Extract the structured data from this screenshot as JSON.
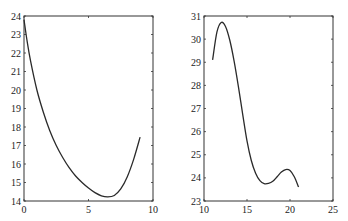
{
  "chart_data": [
    {
      "type": "line",
      "title": "",
      "xlabel": "",
      "ylabel": "",
      "xlim": [
        0,
        10
      ],
      "ylim": [
        14,
        24
      ],
      "grid": false,
      "legend": null,
      "xticks": [
        "0",
        "5",
        "10"
      ],
      "yticks": [
        "14",
        "15",
        "16",
        "17",
        "18",
        "19",
        "20",
        "21",
        "22",
        "23",
        "24"
      ],
      "series": [
        {
          "name": "curve",
          "color": "#2a2a2a",
          "x": [
            0,
            0.25,
            0.5,
            1,
            1.5,
            2,
            2.5,
            3,
            3.5,
            4,
            4.5,
            5,
            5.5,
            6,
            6.5,
            7,
            7.5,
            8,
            8.5,
            9
          ],
          "y": [
            23.8,
            22.6,
            21.6,
            20.0,
            18.8,
            17.8,
            17.0,
            16.35,
            15.8,
            15.35,
            15.0,
            14.7,
            14.45,
            14.28,
            14.22,
            14.3,
            14.65,
            15.3,
            16.25,
            17.45
          ]
        }
      ]
    },
    {
      "type": "line",
      "title": "",
      "xlabel": "",
      "ylabel": "",
      "xlim": [
        10,
        25
      ],
      "ylim": [
        23,
        31
      ],
      "grid": false,
      "legend": null,
      "xticks": [
        "10",
        "15",
        "20",
        "25"
      ],
      "yticks": [
        "23",
        "24",
        "25",
        "26",
        "27",
        "28",
        "29",
        "30",
        "31"
      ],
      "series": [
        {
          "name": "curve",
          "color": "#2a2a2a",
          "x": [
            11,
            11.5,
            12,
            12.5,
            13,
            13.5,
            14,
            14.5,
            15,
            15.5,
            16,
            16.5,
            17,
            17.5,
            18,
            18.5,
            19,
            19.5,
            20,
            20.5,
            21
          ],
          "y": [
            29.1,
            30.3,
            30.72,
            30.55,
            29.95,
            29.05,
            27.95,
            26.75,
            25.6,
            24.75,
            24.2,
            23.88,
            23.75,
            23.76,
            23.85,
            24.05,
            24.25,
            24.36,
            24.32,
            24.05,
            23.6
          ]
        }
      ]
    }
  ]
}
